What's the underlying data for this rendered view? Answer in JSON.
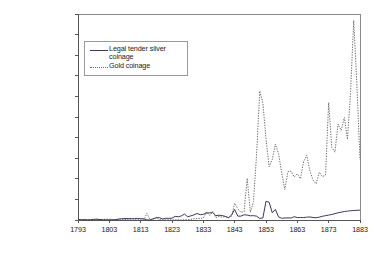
{
  "chart_data": {
    "type": "line",
    "title": "",
    "xlabel": "",
    "ylabel": "",
    "xlim": [
      1793,
      1883
    ],
    "ylim": [
      0,
      100000000
    ],
    "grid": false,
    "legend_position": "upper-left-inside",
    "x_tick_labels": [
      "1793",
      "1803",
      "1813",
      "1823",
      "1833",
      "1843",
      "1853",
      "1863",
      "1873",
      "1883"
    ],
    "x_tick_values": [
      1793,
      1803,
      1813,
      1823,
      1833,
      1843,
      1853,
      1863,
      1873,
      1883
    ],
    "y_tick_labels": [
      "$0",
      "$10,000,000",
      "$20,000,000",
      "$30,000,000",
      "$40,000,000",
      "$50,000,000",
      "$60,000,000",
      "$70,000,000",
      "$80,000,000",
      "$90,000,000",
      "$100,000,000"
    ],
    "y_tick_values": [
      0,
      10000000,
      20000000,
      30000000,
      40000000,
      50000000,
      60000000,
      70000000,
      80000000,
      90000000,
      100000000
    ],
    "series": [
      {
        "name": "Legal tender silver coinage",
        "style": "solid",
        "color": "#3a3a55",
        "x": [
          1793,
          1794,
          1795,
          1796,
          1797,
          1798,
          1799,
          1800,
          1801,
          1802,
          1803,
          1804,
          1805,
          1806,
          1807,
          1808,
          1809,
          1810,
          1811,
          1812,
          1813,
          1814,
          1815,
          1816,
          1817,
          1818,
          1819,
          1820,
          1821,
          1822,
          1823,
          1824,
          1825,
          1826,
          1827,
          1828,
          1829,
          1830,
          1831,
          1832,
          1833,
          1834,
          1835,
          1836,
          1837,
          1838,
          1839,
          1840,
          1841,
          1842,
          1843,
          1844,
          1845,
          1846,
          1847,
          1848,
          1849,
          1850,
          1851,
          1852,
          1853,
          1854,
          1855,
          1856,
          1857,
          1858,
          1859,
          1860,
          1861,
          1862,
          1863,
          1864,
          1865,
          1866,
          1867,
          1868,
          1869,
          1870,
          1871,
          1872,
          1873,
          1874,
          1875,
          1876,
          1877,
          1878,
          1879,
          1880,
          1881,
          1882,
          1883
        ],
        "y": [
          370000,
          77000,
          210000,
          72000,
          78000,
          330000,
          423000,
          224000,
          74000,
          58000,
          87000,
          100000,
          149000,
          471000,
          597000,
          684000,
          707000,
          638000,
          608000,
          814000,
          620000,
          561000,
          17000,
          28000,
          607000,
          1070000,
          1140000,
          501000,
          825000,
          805000,
          895000,
          1752000,
          1564000,
          2002000,
          2869000,
          1575000,
          1994000,
          2495000,
          3175000,
          2579000,
          2759000,
          3415000,
          3443000,
          3606000,
          2096000,
          2333000,
          2176000,
          1726000,
          1132000,
          2333000,
          5140000,
          1873000,
          1873000,
          2558000,
          2374000,
          2040000,
          2114000,
          1866000,
          774000,
          999000,
          9078000,
          8619000,
          3501000,
          5142000,
          1526000,
          833000,
          955000,
          1010000,
          950000,
          1600000,
          1200000,
          1210000,
          1180000,
          1370000,
          1500000,
          1200000,
          1100000,
          1400000,
          1800000,
          2100000,
          2400000,
          2700000,
          3100000,
          3500000,
          3800000,
          4100000,
          4300000,
          4500000,
          4600000,
          4700000,
          4800000
        ]
      },
      {
        "name": "Gold coinage",
        "style": "dotted",
        "color": "#6a6a6a",
        "x": [
          1793,
          1795,
          1796,
          1797,
          1798,
          1799,
          1800,
          1801,
          1802,
          1803,
          1804,
          1805,
          1806,
          1807,
          1808,
          1809,
          1810,
          1811,
          1812,
          1813,
          1814,
          1815,
          1816,
          1817,
          1818,
          1819,
          1820,
          1821,
          1822,
          1823,
          1824,
          1825,
          1826,
          1827,
          1828,
          1829,
          1830,
          1831,
          1832,
          1833,
          1834,
          1835,
          1836,
          1837,
          1838,
          1839,
          1840,
          1841,
          1842,
          1843,
          1844,
          1845,
          1846,
          1847,
          1848,
          1849,
          1850,
          1851,
          1852,
          1853,
          1854,
          1855,
          1856,
          1857,
          1858,
          1859,
          1860,
          1861,
          1862,
          1863,
          1864,
          1865,
          1866,
          1867,
          1868,
          1869,
          1870,
          1871,
          1872,
          1873,
          1874,
          1875,
          1876,
          1877,
          1878,
          1879,
          1880,
          1881,
          1882,
          1883
        ],
        "y": [
          0,
          72000,
          103000,
          205000,
          213000,
          258000,
          258000,
          292000,
          422000,
          424000,
          258000,
          170000,
          324000,
          437000,
          284000,
          169000,
          501000,
          497000,
          290000,
          477000,
          77000,
          3175000,
          242000,
          258000,
          1319000,
          189000,
          88000,
          72000,
          93000,
          72000,
          93000,
          156000,
          92000,
          131000,
          140000,
          295000,
          643000,
          714000,
          798000,
          978000,
          3954000,
          2186000,
          4135000,
          1148000,
          1809000,
          1376000,
          1676000,
          1091000,
          1830000,
          8108000,
          5428000,
          3756000,
          4034000,
          20221000,
          3775000,
          9007000,
          31981000,
          62614000,
          56846000,
          39378000,
          25915000,
          29387000,
          36857000,
          32214000,
          22938000,
          14780000,
          23473000,
          23716000,
          20875000,
          22445000,
          20081000,
          28295000,
          31435000,
          23828000,
          19371000,
          17582000,
          23198000,
          21032000,
          21812000,
          57022000,
          35254000,
          32951000,
          46579000,
          43505000,
          49786000,
          39080000,
          62308000,
          96851000,
          65887000,
          29241000
        ]
      }
    ]
  },
  "legend": {
    "entries": [
      {
        "label_line1": "Legal tender silver",
        "label_line2": "coinage",
        "style": "solid"
      },
      {
        "label_line1": "Gold coinage",
        "label_line2": "",
        "style": "dotted"
      }
    ]
  }
}
